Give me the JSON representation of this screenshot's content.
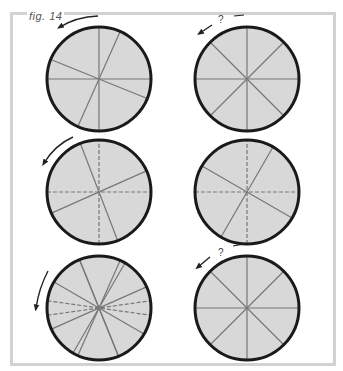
{
  "figure": {
    "label": "fig. 14",
    "frame_color": "#d2d2d2",
    "disc_fill": "#d8d8d8",
    "disc_stroke": "#1a1a1a",
    "spoke_color": "#777777"
  },
  "panels": [
    {
      "id": "top-left",
      "cx": 99,
      "cy": 79,
      "r": 52,
      "arrow": "counterclockwise",
      "question_mark": false,
      "spokes": [
        {
          "angle": 90,
          "dashed": false
        },
        {
          "angle": 0,
          "dashed": false
        },
        {
          "angle": -22,
          "dashed": false
        },
        {
          "angle": 66,
          "dashed": false
        }
      ]
    },
    {
      "id": "top-right",
      "cx": 247,
      "cy": 79,
      "r": 52,
      "arrow": "counterclockwise",
      "question_mark": true,
      "question_text": "?",
      "spokes": [
        {
          "angle": 0,
          "dashed": false
        },
        {
          "angle": 45,
          "dashed": false
        },
        {
          "angle": 90,
          "dashed": false
        },
        {
          "angle": 135,
          "dashed": false
        }
      ]
    },
    {
      "id": "middle-left",
      "cx": 99,
      "cy": 192,
      "r": 52,
      "arrow": "counterclockwise",
      "question_mark": false,
      "spokes": [
        {
          "angle": 0,
          "dashed": true
        },
        {
          "angle": 90,
          "dashed": true
        },
        {
          "angle": 24,
          "dashed": false
        },
        {
          "angle": 111,
          "dashed": false
        }
      ]
    },
    {
      "id": "middle-right",
      "cx": 247,
      "cy": 192,
      "r": 52,
      "arrow": "none",
      "question_mark": false,
      "spokes": [
        {
          "angle": 0,
          "dashed": true
        },
        {
          "angle": 90,
          "dashed": true
        },
        {
          "angle": -30,
          "dashed": false
        },
        {
          "angle": 60,
          "dashed": false
        }
      ]
    },
    {
      "id": "bottom-left",
      "cx": 99,
      "cy": 308,
      "r": 52,
      "arrow": "counterclockwise",
      "question_mark": false,
      "spokes": [
        {
          "angle": 8,
          "dashed": true
        },
        {
          "angle": -8,
          "dashed": true
        },
        {
          "angle": 24,
          "dashed": false
        },
        {
          "angle": -30,
          "dashed": false
        },
        {
          "angle": 60,
          "dashed": false
        },
        {
          "angle": -68,
          "dashed": false
        },
        {
          "angle": 112,
          "dashed": false
        },
        {
          "angle": 66,
          "dashed": false
        }
      ]
    },
    {
      "id": "bottom-right",
      "cx": 247,
      "cy": 308,
      "r": 52,
      "arrow": "counterclockwise",
      "question_mark": true,
      "question_text": "?",
      "spokes": [
        {
          "angle": 0,
          "dashed": false
        },
        {
          "angle": 45,
          "dashed": false
        },
        {
          "angle": 90,
          "dashed": false
        },
        {
          "angle": 135,
          "dashed": false
        }
      ]
    }
  ]
}
